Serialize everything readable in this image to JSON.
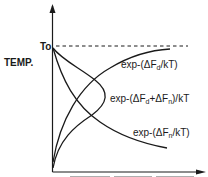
{
  "diagram": {
    "y_axis_label": "TEMP.",
    "reference_line_label": "To",
    "x_axis_label_truncated": true,
    "curves": [
      {
        "id": "fd",
        "label": "exp-(ΔFd/kT)",
        "label_parts": [
          "exp-(ΔF",
          "d",
          "/kT)"
        ],
        "shape": "rising-saturating"
      },
      {
        "id": "sum",
        "label": "exp-(ΔFd+ΔFn)/kT",
        "label_parts": [
          "exp-(ΔF",
          "d",
          "+ΔF",
          "n",
          ")/kT"
        ],
        "shape": "bell"
      },
      {
        "id": "fn",
        "label": "exp-(ΔFn/kT)",
        "label_parts": [
          "exp-(ΔF",
          "n",
          "/kT)"
        ],
        "shape": "decaying"
      }
    ],
    "colors": {
      "ink": "#1a1a1a",
      "background": "#ffffff"
    }
  }
}
